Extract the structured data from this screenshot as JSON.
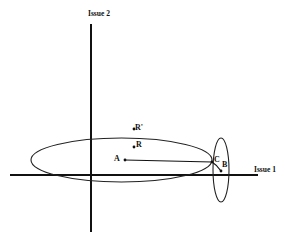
{
  "diagram": {
    "axes": {
      "x_label": "Issue 1",
      "y_label": "Issue 2"
    },
    "points": [
      {
        "id": "A",
        "label": "A"
      },
      {
        "id": "R",
        "label": "R"
      },
      {
        "id": "R_prime",
        "label": "R'"
      },
      {
        "id": "C",
        "label": "C"
      },
      {
        "id": "B",
        "label": "B"
      }
    ],
    "shapes": [
      {
        "type": "ellipse",
        "name": "large-indifference-ellipse",
        "around": "A"
      },
      {
        "type": "ellipse",
        "name": "small-indifference-ellipse",
        "around": "B"
      },
      {
        "type": "segment",
        "from": "A",
        "to": "C"
      },
      {
        "type": "segment",
        "from": "C",
        "to": "B"
      }
    ]
  }
}
